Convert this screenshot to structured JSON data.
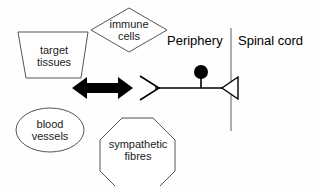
{
  "diagram": {
    "background_color": "#fefefe",
    "outline_color": "#555555",
    "ink_color": "#000000",
    "regions": [
      {
        "id": "periphery",
        "label": "Periphery"
      },
      {
        "id": "spinal-cord",
        "label": "Spinal cord"
      }
    ],
    "nodes": [
      {
        "id": "target-tissues",
        "label": "target\ntissues",
        "shape": "trapezoid"
      },
      {
        "id": "immune-cells",
        "label": "immune\ncells",
        "shape": "diamond"
      },
      {
        "id": "blood-vessels",
        "label": "blood\nvessels",
        "shape": "ellipse"
      },
      {
        "id": "sympathetic-fibres",
        "label": "sympathetic\nfibres",
        "shape": "octagon"
      }
    ],
    "connectors": [
      {
        "id": "bidirectional-arrow",
        "shape": "double-headed-arrow",
        "style": "filled-black"
      },
      {
        "id": "efferent-arrowhead",
        "shape": "open-chevron-right",
        "style": "outline"
      },
      {
        "id": "axon-line",
        "shape": "horizontal-line",
        "style": "solid"
      },
      {
        "id": "soma-node",
        "shape": "filled-circle",
        "style": "filled-black"
      },
      {
        "id": "terminal-triangle",
        "shape": "open-triangle-left",
        "style": "outline"
      },
      {
        "id": "region-divider",
        "shape": "vertical-line",
        "style": "solid-grey"
      }
    ]
  }
}
